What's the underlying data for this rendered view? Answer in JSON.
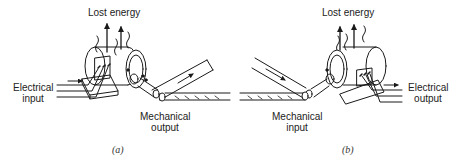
{
  "panels": [
    {
      "id": "a",
      "caption": "(a)",
      "device": "motor",
      "top_label": "Lost energy",
      "side_label_line1": "Electrical",
      "side_label_line2": "input",
      "bottom_label_line1": "Mechanical",
      "bottom_label_line2": "output"
    },
    {
      "id": "b",
      "caption": "(b)",
      "device": "generator",
      "top_label": "Lost energy",
      "side_label_line1": "Electrical",
      "side_label_line2": "output",
      "bottom_label_line1": "Mechanical",
      "bottom_label_line2": "input"
    }
  ],
  "colors": {
    "ink": "#1a1a1a",
    "background": "#ffffff"
  }
}
